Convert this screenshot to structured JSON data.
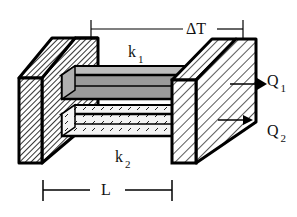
{
  "diagram": {
    "labels": {
      "delta_t": "ΔT",
      "k1": {
        "base": "k",
        "sub": "1"
      },
      "k2": {
        "base": "k",
        "sub": "2"
      },
      "q1": {
        "base": "Q",
        "sub": "1"
      },
      "q2": {
        "base": "Q",
        "sub": "2"
      },
      "length": "L"
    },
    "colors": {
      "stroke": "#000000",
      "rod_top_fill": "#9a9a9a",
      "rod_top_light": "#bdbdbd",
      "rod_bottom_fill": "#f2f2f2",
      "background": "#ffffff"
    }
  }
}
